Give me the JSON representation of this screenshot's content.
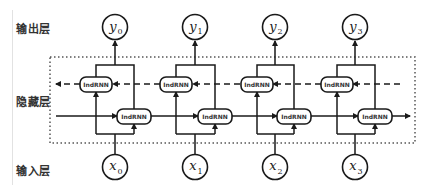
{
  "layers": {
    "output": "输出层",
    "hidden": "隐藏层",
    "input": "输入层"
  },
  "cell_label": "IndRNN",
  "outputs": [
    {
      "name": "y",
      "sub": "0"
    },
    {
      "name": "y",
      "sub": "1"
    },
    {
      "name": "y",
      "sub": "2"
    },
    {
      "name": "y",
      "sub": "3"
    }
  ],
  "inputs": [
    {
      "name": "x",
      "sub": "0"
    },
    {
      "name": "x",
      "sub": "1"
    },
    {
      "name": "x",
      "sub": "2"
    },
    {
      "name": "x",
      "sub": "3"
    }
  ],
  "colors": {
    "stroke": "#1a1a1a",
    "dotted_border": "#555555"
  }
}
